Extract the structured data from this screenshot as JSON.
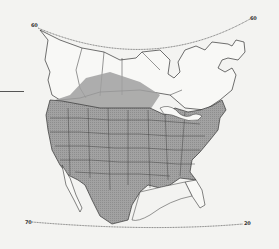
{
  "map": {
    "type": "range-map",
    "region": "North America",
    "projection_labels": {
      "top_left": "60",
      "top_right": "60",
      "bottom_left": "70",
      "bottom_right": "20"
    },
    "colors": {
      "background": "#f3f3f1",
      "land": "#f7f7f5",
      "range_fill": "#9c9c9c",
      "borders": "#3a3a3a"
    },
    "legend": {
      "range_shading": "shaded area indicates species range"
    },
    "range_extent": [
      "contiguous United States",
      "southern Canadian prairies",
      "northern Mexico"
    ]
  }
}
